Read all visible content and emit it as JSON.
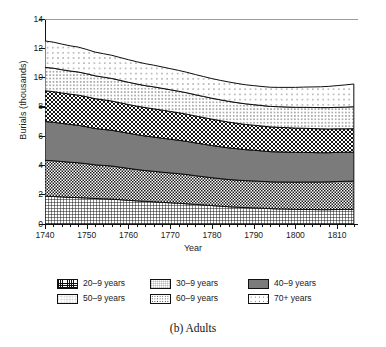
{
  "chart_data": {
    "type": "area",
    "stacked": true,
    "title": "",
    "caption": "(b) Adults",
    "xlabel": "Year",
    "ylabel": "Burials (thousands)",
    "xlim": [
      1740,
      1815
    ],
    "ylim": [
      0,
      14
    ],
    "ytick_values": [
      0,
      2,
      4,
      6,
      8,
      10,
      12,
      14
    ],
    "ytick_labels": [
      "0",
      "2",
      "4",
      "6",
      "8",
      "10",
      "12",
      "14"
    ],
    "ytick_step": 2,
    "xtick_values": [
      1740,
      1750,
      1760,
      1770,
      1780,
      1790,
      1800,
      1810
    ],
    "xtick_labels": [
      "1740",
      "1750",
      "1760",
      "1770",
      "1780",
      "1790",
      "1800",
      "1810"
    ],
    "xtick_minor_step": 2,
    "grid": false,
    "legend_position": "below-plot",
    "legend_columns": 3,
    "x": [
      1740,
      1742,
      1744,
      1746,
      1748,
      1750,
      1752,
      1754,
      1756,
      1758,
      1760,
      1762,
      1764,
      1766,
      1768,
      1770,
      1772,
      1774,
      1776,
      1778,
      1780,
      1782,
      1784,
      1786,
      1788,
      1790,
      1792,
      1794,
      1796,
      1798,
      1800,
      1802,
      1804,
      1806,
      1808,
      1810,
      1812,
      1814
    ],
    "series": [
      {
        "name": "20–9 years",
        "pattern": "grid-fine",
        "values": [
          1.9,
          1.88,
          1.85,
          1.82,
          1.8,
          1.78,
          1.74,
          1.72,
          1.7,
          1.66,
          1.62,
          1.58,
          1.55,
          1.52,
          1.48,
          1.45,
          1.42,
          1.38,
          1.34,
          1.3,
          1.26,
          1.22,
          1.18,
          1.15,
          1.12,
          1.1,
          1.08,
          1.05,
          1.03,
          1.02,
          1.0,
          1.0,
          0.99,
          0.98,
          0.98,
          0.99,
          1.0,
          1.0
        ]
      },
      {
        "name": "30–9 years",
        "pattern": "check-small",
        "values": [
          2.45,
          2.44,
          2.42,
          2.4,
          2.38,
          2.34,
          2.3,
          2.28,
          2.26,
          2.22,
          2.18,
          2.14,
          2.1,
          2.08,
          2.06,
          2.04,
          2.02,
          2.0,
          1.96,
          1.93,
          1.9,
          1.88,
          1.86,
          1.85,
          1.84,
          1.84,
          1.83,
          1.83,
          1.84,
          1.85,
          1.86,
          1.87,
          1.88,
          1.89,
          1.9,
          1.91,
          1.92,
          1.93
        ]
      },
      {
        "name": "40–9 years",
        "pattern": "solid-gray",
        "values": [
          2.65,
          2.63,
          2.6,
          2.58,
          2.56,
          2.52,
          2.48,
          2.46,
          2.44,
          2.42,
          2.4,
          2.38,
          2.36,
          2.34,
          2.32,
          2.3,
          2.28,
          2.26,
          2.24,
          2.22,
          2.2,
          2.18,
          2.16,
          2.14,
          2.12,
          2.1,
          2.08,
          2.06,
          2.05,
          2.04,
          2.03,
          2.02,
          2.01,
          2.0,
          1.99,
          1.99,
          1.98,
          1.98
        ]
      },
      {
        "name": "50–9 years",
        "pattern": "check-med",
        "values": [
          2.1,
          2.09,
          2.08,
          2.07,
          2.06,
          2.05,
          2.04,
          2.02,
          2.0,
          1.98,
          1.96,
          1.95,
          1.94,
          1.93,
          1.92,
          1.9,
          1.88,
          1.86,
          1.84,
          1.82,
          1.8,
          1.78,
          1.76,
          1.74,
          1.72,
          1.71,
          1.7,
          1.69,
          1.68,
          1.67,
          1.66,
          1.65,
          1.64,
          1.63,
          1.62,
          1.61,
          1.6,
          1.6
        ]
      },
      {
        "name": "60–9 years",
        "pattern": "dots-dense",
        "values": [
          1.6,
          1.6,
          1.59,
          1.58,
          1.58,
          1.57,
          1.56,
          1.55,
          1.54,
          1.53,
          1.52,
          1.51,
          1.5,
          1.5,
          1.49,
          1.48,
          1.47,
          1.46,
          1.45,
          1.44,
          1.43,
          1.42,
          1.42,
          1.41,
          1.41,
          1.4,
          1.4,
          1.4,
          1.41,
          1.41,
          1.42,
          1.43,
          1.44,
          1.45,
          1.46,
          1.47,
          1.48,
          1.5
        ]
      },
      {
        "name": "70+ years",
        "pattern": "dots-sparse",
        "values": [
          1.8,
          1.78,
          1.75,
          1.72,
          1.7,
          1.66,
          1.62,
          1.6,
          1.58,
          1.56,
          1.54,
          1.52,
          1.5,
          1.48,
          1.46,
          1.44,
          1.42,
          1.4,
          1.38,
          1.36,
          1.34,
          1.33,
          1.32,
          1.31,
          1.3,
          1.3,
          1.3,
          1.31,
          1.32,
          1.34,
          1.36,
          1.38,
          1.4,
          1.42,
          1.45,
          1.48,
          1.52,
          1.55
        ]
      }
    ],
    "totals_note": "stacked top ranges from about 12.5 at 1740 down to about 10.4 at 1814"
  },
  "legend": {
    "items": [
      {
        "label": "20–9 years",
        "pattern": "grid-fine"
      },
      {
        "label": "30–9 years",
        "pattern": "check-small"
      },
      {
        "label": "40–9 years",
        "pattern": "solid-gray"
      },
      {
        "label": "50–9 years",
        "pattern": "check-med"
      },
      {
        "label": "60–9 years",
        "pattern": "dots-dense"
      },
      {
        "label": "70+ years",
        "pattern": "dots-sparse"
      }
    ]
  },
  "colors": {
    "axis": "#111111",
    "solid_band": "#7b7b7b",
    "background": "#ffffff"
  }
}
